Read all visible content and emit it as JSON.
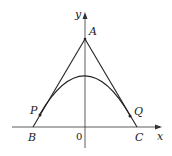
{
  "diagram": {
    "type": "geometry",
    "axes": {
      "x_label": "x",
      "y_label": "y",
      "origin_label": "0"
    },
    "points": {
      "A": {
        "label": "A"
      },
      "B": {
        "label": "B"
      },
      "C": {
        "label": "C"
      },
      "P": {
        "label": "P"
      },
      "Q": {
        "label": "Q"
      }
    },
    "colors": {
      "stroke": "#222222",
      "background": "#ffffff"
    }
  }
}
